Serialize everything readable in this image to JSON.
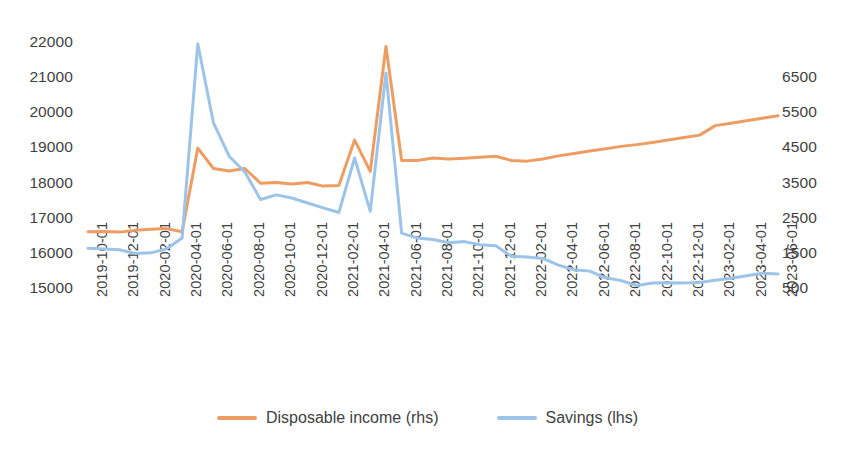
{
  "chart_data": {
    "type": "line",
    "title": "",
    "xlabel": "",
    "ylabel": "",
    "grid": false,
    "legend_position": "bottom",
    "x": [
      "2019-10-01",
      "2019-11-01",
      "2019-12-01",
      "2020-01-01",
      "2020-02-01",
      "2020-03-01",
      "2020-04-01",
      "2020-05-01",
      "2020-06-01",
      "2020-07-01",
      "2020-08-01",
      "2020-09-01",
      "2020-10-01",
      "2020-11-01",
      "2020-12-01",
      "2021-01-01",
      "2021-02-01",
      "2021-03-01",
      "2021-04-01",
      "2021-05-01",
      "2021-06-01",
      "2021-07-01",
      "2021-08-01",
      "2021-09-01",
      "2021-10-01",
      "2021-11-01",
      "2021-12-01",
      "2022-01-01",
      "2022-02-01",
      "2022-03-01",
      "2022-04-01",
      "2022-05-01",
      "2022-06-01",
      "2022-07-01",
      "2022-08-01",
      "2022-09-01",
      "2022-10-01",
      "2022-11-01",
      "2022-12-01",
      "2023-01-01",
      "2023-02-01",
      "2023-03-01",
      "2023-04-01",
      "2023-05-01",
      "2023-06-01"
    ],
    "tick_labels": [
      "2019-10-01",
      "2019-12-01",
      "2020-02-01",
      "2020-04-01",
      "2020-06-01",
      "2020-08-01",
      "2020-10-01",
      "2020-12-01",
      "2021-02-01",
      "2021-04-01",
      "2021-06-01",
      "2021-08-01",
      "2021-10-01",
      "2021-12-01",
      "2022-02-01",
      "2022-04-01",
      "2022-06-01",
      "2022-08-01",
      "2022-10-01",
      "2022-12-01",
      "2023-02-01",
      "2023-04-01",
      "2023-06-01"
    ],
    "tick_every": 2,
    "axes": {
      "left": {
        "name": "lhs",
        "ticks": [
          15000,
          16000,
          17000,
          18000,
          19000,
          20000,
          21000,
          22000
        ],
        "min": 15000,
        "max": 22000
      },
      "right": {
        "name": "rhs",
        "ticks": [
          500,
          1500,
          2500,
          3500,
          4500,
          5500,
          6500
        ],
        "min": -500,
        "max": 6500
      }
    },
    "series": [
      {
        "name": "Disposable income (rhs)",
        "axis": "right",
        "color": "#ED9C62",
        "values": [
          3320,
          3330,
          3300,
          3360,
          3400,
          3420,
          3300,
          5450,
          4800,
          4720,
          4800,
          4280,
          4300,
          4250,
          4300,
          4180,
          4200,
          5600,
          4600,
          6400,
          3950,
          3950,
          4030,
          4000,
          4020,
          4050,
          4080,
          3950,
          3930,
          3990,
          4100,
          4180,
          4260,
          4320,
          4400,
          4450,
          4520,
          4600,
          4680,
          4760,
          5080,
          5150,
          5230,
          5300,
          5380
        ],
        "plot_values_lhs": [
          16600,
          16610,
          16590,
          16640,
          16670,
          16690,
          16600,
          18980,
          18400,
          18330,
          18400,
          17980,
          18000,
          17960,
          18000,
          17900,
          17920,
          19210,
          18320,
          21870,
          18630,
          18630,
          18700,
          18670,
          18690,
          18720,
          18750,
          18630,
          18610,
          18670,
          18760,
          18830,
          18900,
          18960,
          19030,
          19080,
          19140,
          19210,
          19280,
          19350,
          19620,
          19690,
          19760,
          19830,
          19900
        ]
      },
      {
        "name": "Savings (lhs)",
        "axis": "left",
        "color": "#9CC3E8",
        "values": [
          16130,
          16110,
          16090,
          15980,
          16000,
          16110,
          16420,
          21950,
          19700,
          18750,
          18300,
          17520,
          17650,
          17560,
          17420,
          17280,
          17150,
          18700,
          17180,
          21120,
          16560,
          16420,
          16380,
          16290,
          16320,
          16230,
          16200,
          15900,
          15880,
          15840,
          15650,
          15520,
          15480,
          15290,
          15210,
          15070,
          15140,
          15150,
          15140,
          15160,
          15220,
          15280,
          15350,
          15420,
          15400
        ]
      }
    ]
  },
  "legend": {
    "items": [
      {
        "label": "Disposable income (rhs)",
        "color": "#ED9C62"
      },
      {
        "label": "Savings (lhs)",
        "color": "#9CC3E8"
      }
    ]
  }
}
